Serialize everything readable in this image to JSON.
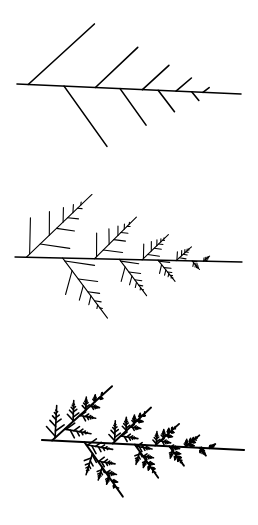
{
  "figure": {
    "background": "#ffffff",
    "ink": "#000000",
    "panels": [
      {
        "name": "fern-iteration-1",
        "depth": 1,
        "stem": {
          "x1": 17,
          "y1": 84,
          "x2": 241,
          "y2": 94
        },
        "stroke_width": 1.6
      },
      {
        "name": "fern-iteration-2",
        "depth": 2,
        "stem": {
          "x1": 15,
          "y1": 257,
          "x2": 242,
          "y2": 262
        },
        "stroke_width": 1.3
      },
      {
        "name": "fern-iteration-3",
        "depth": 3,
        "stem": {
          "x1": 42,
          "y1": 440,
          "x2": 244,
          "y2": 450
        },
        "stroke_width": 2.2
      }
    ],
    "branch_rule": {
      "upper": [
        {
          "t": 0.05,
          "len": 0.4,
          "angle": -45
        },
        {
          "t": 0.35,
          "len": 0.26,
          "angle": -46
        },
        {
          "t": 0.56,
          "len": 0.16,
          "angle": -45
        },
        {
          "t": 0.71,
          "len": 0.09,
          "angle": -43
        },
        {
          "t": 0.83,
          "len": 0.035,
          "angle": -40
        }
      ],
      "lower": [
        {
          "t": 0.21,
          "len": 0.33,
          "angle": 52
        },
        {
          "t": 0.46,
          "len": 0.2,
          "angle": 52
        },
        {
          "t": 0.63,
          "len": 0.12,
          "angle": 50
        },
        {
          "t": 0.78,
          "len": 0.05,
          "angle": 48
        }
      ]
    }
  }
}
